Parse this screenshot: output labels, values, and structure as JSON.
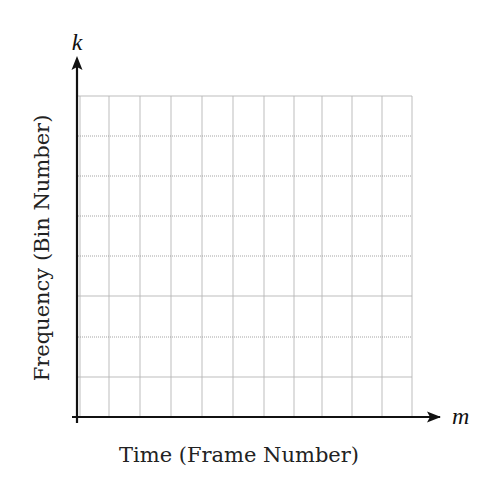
{
  "diagram": {
    "type": "empty spectrogram grid (time-frequency plane)",
    "x_axis": {
      "variable": "m",
      "label": "Time (Frame Number)"
    },
    "y_axis": {
      "variable": "k",
      "label": "Frequency (Bin Number)"
    },
    "grid": {
      "columns": 11,
      "rows": 8,
      "vertical_lines_x": [
        80,
        109,
        140,
        171,
        202,
        233,
        264,
        294,
        322,
        352,
        382,
        412
      ],
      "horizontal_lines": [
        {
          "y": 96,
          "style": "solid"
        },
        {
          "y": 136,
          "style": "dotted"
        },
        {
          "y": 176,
          "style": "dotted"
        },
        {
          "y": 216,
          "style": "dotted"
        },
        {
          "y": 256,
          "style": "dotted"
        },
        {
          "y": 296,
          "style": "solid"
        },
        {
          "y": 337,
          "style": "dotted"
        },
        {
          "y": 377,
          "style": "solid"
        }
      ],
      "left": 78,
      "right": 412,
      "top": 96,
      "bottom": 417
    },
    "colors": {
      "axis": "#111111",
      "grid": "#b5b5b5",
      "text": "#222222"
    }
  }
}
